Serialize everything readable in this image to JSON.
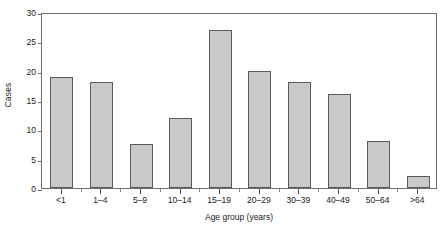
{
  "chart_data": {
    "type": "bar",
    "title": "",
    "subtitle": "",
    "xlabel": "Age group (years)",
    "ylabel": "Cases",
    "categories": [
      "<1",
      "1–4",
      "5–9",
      "10–14",
      "15–19",
      "20–29",
      "30–39",
      "40–49",
      "50–64",
      ">64"
    ],
    "values": [
      19,
      18,
      7.5,
      12,
      27,
      20,
      18,
      16,
      8,
      2
    ],
    "series": [
      {
        "name": "Cases",
        "values": [
          19,
          18,
          7.5,
          12,
          27,
          20,
          18,
          16,
          8,
          2
        ]
      }
    ],
    "ylim": [
      0,
      30
    ],
    "y_ticks": [
      0,
      5,
      10,
      15,
      20,
      25,
      30
    ],
    "y_tick_labels": [
      "0",
      "5",
      "10",
      "15",
      "20",
      "25",
      "30"
    ],
    "grid": false,
    "legend": false,
    "legend_position": "none",
    "annotations": [],
    "bar_fill_color": "#c9c9c9",
    "bar_border_color": "#5a5a5a",
    "axis_color": "#6e6e6e",
    "background_color": "#ffffff"
  }
}
